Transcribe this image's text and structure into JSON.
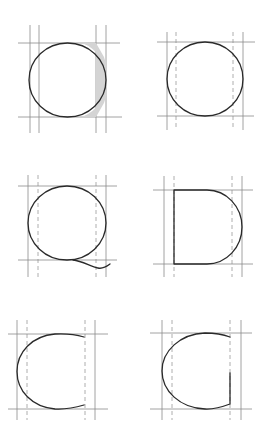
{
  "diagram": {
    "title": "",
    "colors": {
      "background": "#ffffff",
      "guide_line": "#8a8a8a",
      "guide_dashed": "#9a9a9a",
      "glyph_stroke": "#2a2a2a",
      "shade": "#d4d4d4"
    },
    "panels": [
      {
        "id": "panel-o-shaded",
        "letter": "O",
        "variant": "circle with shaded overshoot region",
        "guides": {
          "solid_x": [
            30,
            39,
            96,
            106
          ],
          "dashed_x": [],
          "y": [
            43,
            117
          ]
        }
      },
      {
        "id": "panel-o",
        "letter": "O",
        "variant": "circle",
        "guides": {
          "solid_x": [
            167,
            243
          ],
          "dashed_x": [
            176,
            233
          ],
          "y": [
            42,
            116
          ]
        }
      },
      {
        "id": "panel-q",
        "letter": "Q",
        "variant": "circle with tail",
        "guides": {
          "solid_x": [
            28,
            106
          ],
          "dashed_x": [
            38,
            96
          ],
          "y": [
            186,
            260
          ]
        }
      },
      {
        "id": "panel-d",
        "letter": "D",
        "variant": "stem with semicircular bowl",
        "guides": {
          "solid_x": [
            164,
            242
          ],
          "dashed_x": [
            174,
            232
          ],
          "y": [
            190,
            264
          ]
        }
      },
      {
        "id": "panel-c",
        "letter": "C",
        "variant": "open arc",
        "guides": {
          "solid_x": [
            17,
            95
          ],
          "dashed_x": [
            27,
            85
          ],
          "y": [
            334,
            409
          ]
        }
      },
      {
        "id": "panel-g",
        "letter": "G",
        "variant": "open arc with vertical spur",
        "guides": {
          "solid_x": [
            162,
            241
          ],
          "dashed_x": [
            172,
            230
          ],
          "y": [
            333,
            409
          ]
        }
      }
    ]
  }
}
